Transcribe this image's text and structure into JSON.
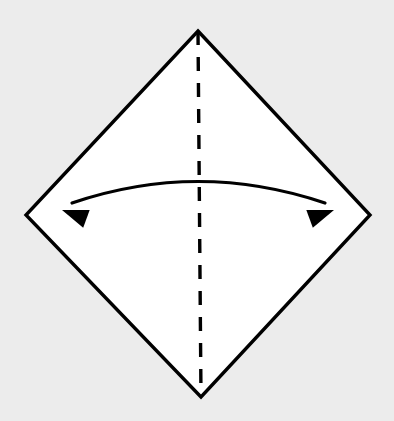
{
  "figure": {
    "type": "origami-instruction",
    "canvas": {
      "width": 394,
      "height": 421
    },
    "background_color": "#ececec",
    "paper": {
      "name": "square-paper-diamond",
      "fill_color": "#ffffff",
      "stroke_color": "#000000",
      "stroke_width": 3.4,
      "orientation": "diamond",
      "vertices": [
        {
          "label": "top",
          "x": 198,
          "y": 31
        },
        {
          "label": "right",
          "x": 370,
          "y": 215
        },
        {
          "label": "bottom",
          "x": 201,
          "y": 397
        },
        {
          "label": "left",
          "x": 26,
          "y": 215
        }
      ]
    },
    "fold_line": {
      "name": "vertical-valley-fold-line",
      "style": "dashed",
      "stroke_color": "#000000",
      "stroke_width": 3.4,
      "dash_length": 14,
      "gap_length": 12,
      "from": {
        "x": 198,
        "y": 31
      },
      "to": {
        "x": 201,
        "y": 397
      }
    },
    "fold_arrow": {
      "name": "double-headed-fold-arrow",
      "style": "curved",
      "heads": "both",
      "stroke_color": "#000000",
      "stroke_width": 3.2,
      "start": {
        "x": 72,
        "y": 203
      },
      "end": {
        "x": 325,
        "y": 203
      },
      "control": {
        "x": 198,
        "y": 160
      },
      "apex": {
        "x": 197,
        "y": 177
      },
      "arrowhead_left": {
        "tip_x": 62,
        "tip_y": 210,
        "angle_deg": 200
      },
      "arrowhead_right": {
        "tip_x": 334,
        "tip_y": 210,
        "angle_deg": -20
      },
      "arrowhead_length": 26,
      "arrowhead_width": 19
    }
  }
}
